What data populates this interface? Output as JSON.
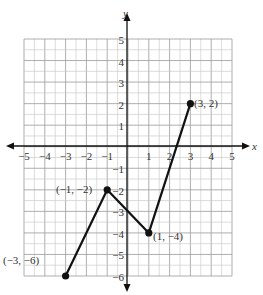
{
  "chart_data": {
    "type": "line",
    "title": "",
    "xlabel": "x",
    "ylabel": "y",
    "xlim": [
      -5,
      5
    ],
    "ylim": [
      -6,
      5
    ],
    "grid": true,
    "grid_minor_step": 0.5,
    "x_ticks": [
      "-5",
      "-4",
      "-3",
      "-2",
      "-1",
      "1",
      "2",
      "3",
      "4",
      "5"
    ],
    "y_ticks": [
      "5",
      "4",
      "3",
      "2",
      "1",
      "-1",
      "-2",
      "-3",
      "-4",
      "-5",
      "-6"
    ],
    "series": [
      {
        "name": "piecewise linear function",
        "points": [
          [
            -3,
            -6
          ],
          [
            -1,
            -2
          ],
          [
            1,
            -4
          ],
          [
            3,
            2
          ]
        ],
        "color": "#111111"
      }
    ],
    "annotations": [
      {
        "text": "(−3, −6)",
        "x": -3,
        "y": -6
      },
      {
        "text": "(−1, −2)",
        "x": -1,
        "y": -2
      },
      {
        "text": "(1, −4)",
        "x": 1,
        "y": -4
      },
      {
        "text": "(3, 2)",
        "x": 3,
        "y": 2
      }
    ]
  },
  "labels": {
    "x_axis": "x",
    "y_axis": "y",
    "pt1": "(−3, −6)",
    "pt2": "(−1, −2)",
    "pt3": "(1, −4)",
    "pt4": "(3, 2)",
    "xt": [
      "−5",
      "−4",
      "−3",
      "−2",
      "−1",
      "1",
      "2",
      "3",
      "4",
      "5"
    ],
    "yt": [
      "5",
      "4",
      "3",
      "2",
      "1",
      "−1",
      "−2",
      "−3",
      "−4",
      "−5",
      "−6"
    ]
  }
}
